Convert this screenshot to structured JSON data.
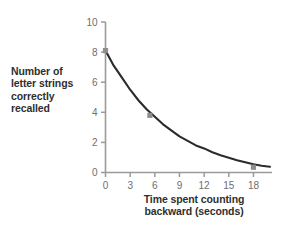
{
  "chart_data": {
    "type": "line",
    "title": "",
    "subtitle": "",
    "xlabel": "Time spent counting backward (seconds)",
    "xlabel_lines": [
      "Time spent counting",
      "backward (seconds)"
    ],
    "ylabel": "Number of letter strings correctly recalled",
    "ylabel_lines": [
      "Number of",
      "letter strings",
      "correctly",
      "recalled"
    ],
    "xlim": [
      0,
      20
    ],
    "ylim": [
      0,
      10
    ],
    "xticks": [
      0,
      3,
      6,
      9,
      12,
      15,
      18
    ],
    "xticklabels": [
      "0",
      "3",
      "6",
      "9",
      "12",
      "15",
      "18"
    ],
    "yticks": [
      0,
      2,
      4,
      6,
      8,
      10
    ],
    "yticklabels": [
      "0",
      "2",
      "4",
      "6",
      "8",
      "10"
    ],
    "grid": false,
    "legend": null,
    "series": [
      {
        "name": "Recall",
        "curve_color": "#2b2b2b",
        "marker_color": "#8e8e8e",
        "x": [
          0,
          1,
          2,
          3,
          4,
          5,
          6,
          7,
          8,
          9,
          10,
          11,
          12,
          13,
          14,
          15,
          16,
          17,
          18,
          19,
          20
        ],
        "values": [
          8.1,
          7.1,
          6.3,
          5.5,
          4.8,
          4.2,
          3.7,
          3.2,
          2.8,
          2.4,
          2.1,
          1.8,
          1.6,
          1.35,
          1.15,
          0.98,
          0.82,
          0.68,
          0.55,
          0.45,
          0.38
        ]
      }
    ],
    "data_points": [
      {
        "x": 0,
        "y": 8.1
      },
      {
        "x": 5.4,
        "y": 3.8
      },
      {
        "x": 18,
        "y": 0.35
      }
    ],
    "axis_color": "#9a9a9a",
    "tick_label_color": "#6e6e6e",
    "label_color": "#2f2f2f",
    "background": "#ffffff"
  }
}
